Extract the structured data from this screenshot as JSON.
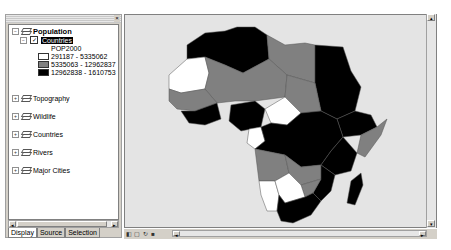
{
  "toc": {
    "close_glyph": "×",
    "root_layer": {
      "label": "Population",
      "expander": "−"
    },
    "sublayer": {
      "label": "Countries",
      "checked": true,
      "expander": "−"
    },
    "legend": {
      "field": "POP2000",
      "classes": [
        {
          "label": "291187 - 5335062",
          "color": "#ffffff"
        },
        {
          "label": "5335063 - 12962837",
          "color": "#808080"
        },
        {
          "label": "12962838 - 1610753",
          "color": "#000000"
        }
      ]
    },
    "layers": [
      {
        "label": "Topography",
        "expander": "+"
      },
      {
        "label": "Wildlife",
        "expander": "+"
      },
      {
        "label": "Countries",
        "expander": "+"
      },
      {
        "label": "Rivers",
        "expander": "+"
      },
      {
        "label": "Major Cities",
        "expander": "+"
      }
    ],
    "scroll_left": "◂",
    "scroll_right": "▸",
    "tabs": [
      {
        "label": "Display",
        "active": true
      },
      {
        "label": "Source",
        "active": false
      },
      {
        "label": "Selection",
        "active": false
      }
    ]
  },
  "map": {
    "title": "Africa population map",
    "scroll_up": "▴",
    "scroll_down": "▾"
  },
  "statusbar": {
    "icons": [
      "◧",
      "▢",
      "↻",
      "■"
    ],
    "scroll_left": "◂",
    "scroll_right": "▸"
  }
}
